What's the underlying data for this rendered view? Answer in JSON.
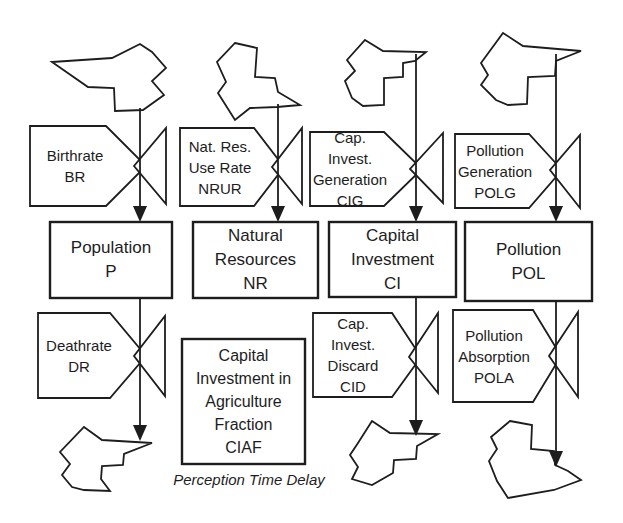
{
  "colors": {
    "ink": "#1d1d1d",
    "paper": "#ffffff"
  },
  "stocks": [
    {
      "id": "population",
      "label_lines": [
        "Population",
        "P"
      ]
    },
    {
      "id": "natural-resources",
      "label_lines": [
        "Natural",
        "Resources",
        "NR"
      ]
    },
    {
      "id": "capital-investment",
      "label_lines": [
        "Capital",
        "Investment",
        "CI"
      ]
    },
    {
      "id": "pollution",
      "label_lines": [
        "Pollution",
        "POL"
      ]
    }
  ],
  "valves": [
    {
      "id": "birthrate",
      "label_lines": [
        "Birthrate",
        "BR"
      ]
    },
    {
      "id": "nat-res-use-rate",
      "label_lines": [
        "Nat. Res.",
        "Use Rate",
        "NRUR"
      ]
    },
    {
      "id": "cap-invest-generation",
      "label_lines": [
        "Cap. Invest.",
        "Generation",
        "CIG"
      ]
    },
    {
      "id": "pollution-generation",
      "label_lines": [
        "Pollution",
        "Generation",
        "POLG"
      ]
    },
    {
      "id": "deathrate",
      "label_lines": [
        "Deathrate",
        "DR"
      ]
    },
    {
      "id": "cap-invest-discard",
      "label_lines": [
        "Cap. Invest.",
        "Discard",
        "CID"
      ]
    },
    {
      "id": "pollution-absorption",
      "label_lines": [
        "Pollution",
        "Absorption",
        "POLA"
      ]
    }
  ],
  "auxiliary": {
    "id": "ciaf",
    "label_lines": [
      "Capital",
      "Investment in",
      "Agriculture",
      "Fraction",
      "CIAF"
    ]
  },
  "caption": {
    "text": "Perception Time Delay"
  }
}
